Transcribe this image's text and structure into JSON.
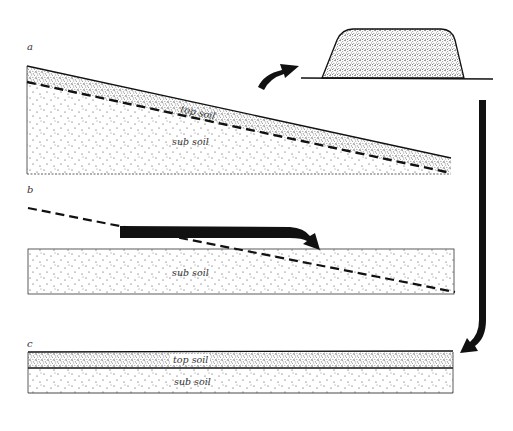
{
  "diagram": {
    "panels": [
      {
        "id": "a",
        "letter": "a",
        "layers": [
          {
            "name": "top soil",
            "label": "top soil"
          },
          {
            "name": "sub soil",
            "label": "sub soil"
          }
        ],
        "description": "Sloping ground with top soil layer over sub soil; dashed line marks the intended cut level"
      },
      {
        "id": "b",
        "letter": "b",
        "layers": [
          {
            "name": "sub soil",
            "label": "sub soil"
          }
        ],
        "description": "Top soil removed; sub soil cut from the high side and moved to fill the low side, producing a level platform"
      },
      {
        "id": "c",
        "letter": "c",
        "layers": [
          {
            "name": "top soil",
            "label": "top soil"
          },
          {
            "name": "sub soil",
            "label": "sub soil"
          }
        ],
        "description": "Stockpiled top soil spread back over the levelled sub soil"
      }
    ],
    "stockpile": {
      "label": ""
    },
    "arrows": [
      {
        "from": "panel-a-top-soil",
        "to": "stockpile",
        "meaning": "top soil stripped and heaped"
      },
      {
        "from": "panel-b-high-side",
        "to": "panel-b-low-side",
        "meaning": "sub soil cut and filled"
      },
      {
        "from": "stockpile",
        "to": "panel-c-top-soil",
        "meaning": "top soil returned"
      }
    ],
    "colors": {
      "ink": "#111111",
      "paper": "#ffffff",
      "text": "#333333"
    }
  }
}
